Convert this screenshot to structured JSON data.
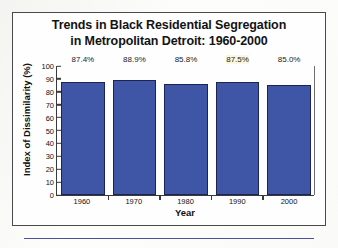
{
  "figure": {
    "title_line1": "Trends in Black Residential Segregation",
    "title_line2": "in Metropolitan Detroit: 1960-2000"
  },
  "chart_data": {
    "type": "bar",
    "title": "Trends in Black Residential Segregation in Metropolitan Detroit: 1960-2000",
    "xlabel": "Year",
    "ylabel": "Index of Dissimilarity (%)",
    "categories": [
      "1960",
      "1970",
      "1980",
      "1990",
      "2000"
    ],
    "values": [
      87.4,
      88.9,
      85.8,
      87.5,
      85.0
    ],
    "data_labels": [
      "87.4%",
      "88.9%",
      "85.8%",
      "87.5%",
      "85.0%"
    ],
    "ylim": [
      0,
      100
    ],
    "yticks": [
      "0",
      "10",
      "20",
      "30",
      "40",
      "50",
      "60",
      "70",
      "80",
      "90",
      "100"
    ],
    "grid": false,
    "legend": false,
    "bar_color": "#3f55a5",
    "bar_border_color": "#1b2455"
  },
  "decor": {
    "rule_color": "#4b4fa0"
  }
}
